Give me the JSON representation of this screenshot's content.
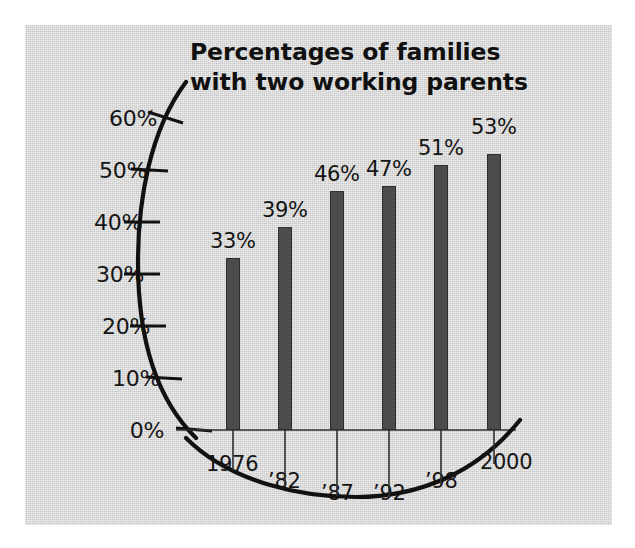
{
  "chart_data": {
    "type": "bar",
    "title": "Percentages of families with two working parents",
    "title_line1": "Percentages of families",
    "title_line2": "with two working parents",
    "xlabel": "",
    "ylabel": "",
    "categories": [
      "1976",
      "’82",
      "’87",
      "’92",
      "’98",
      "2000"
    ],
    "values": [
      33,
      39,
      46,
      47,
      51,
      53
    ],
    "value_labels": [
      "33%",
      "39%",
      "46%",
      "47%",
      "51%",
      "53%"
    ],
    "ylim": [
      0,
      60
    ],
    "ytick_values": [
      0,
      10,
      20,
      30,
      40,
      50,
      60
    ],
    "ytick_labels": [
      "0%",
      "10%",
      "20%",
      "30%",
      "40%",
      "50%",
      "60%"
    ],
    "grid": false,
    "legend": null,
    "axis_style": "curved-arc-y-axis"
  },
  "colors": {
    "panel_background": "#d4d4d4",
    "figure_background": "#ffffff",
    "bar_fill": "#4c4c4c",
    "bar_stroke": "#2e2e2e",
    "axis_line": "#111111",
    "text": "#141414"
  },
  "geometry": {
    "ytick_y": [
      430,
      378,
      326,
      274,
      222,
      170,
      118
    ],
    "ytick_label_x": [
      167,
      167,
      154,
      152,
      152,
      152,
      164
    ],
    "bar_x": [
      226,
      278,
      330,
      382,
      434,
      487
    ],
    "bar_width": 14,
    "baseline_y": 430,
    "value_label_x": [
      210,
      262,
      314,
      366,
      418,
      471
    ],
    "value_label_y": [
      229,
      198,
      162,
      157,
      136,
      115
    ],
    "xtick_label_x": [
      208,
      268,
      320,
      372,
      424,
      480
    ],
    "xtick_label_y": [
      454,
      470,
      482,
      482,
      470,
      452
    ]
  }
}
